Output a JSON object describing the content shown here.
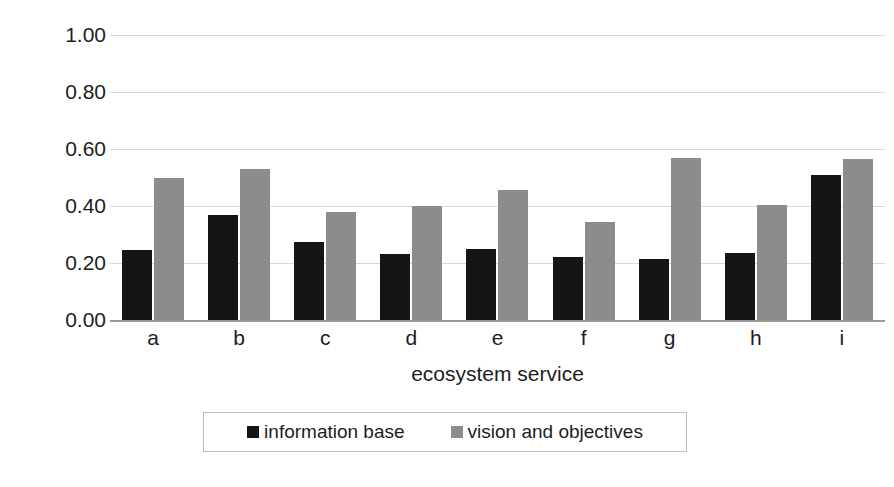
{
  "chart_data": {
    "type": "bar",
    "title": "",
    "xlabel": "ecosystem service",
    "ylabel": "depth score",
    "categories": [
      "a",
      "b",
      "c",
      "d",
      "e",
      "f",
      "g",
      "h",
      "i"
    ],
    "series": [
      {
        "name": "information base",
        "color": "#151515",
        "values": [
          0.245,
          0.37,
          0.275,
          0.23,
          0.25,
          0.22,
          0.215,
          0.235,
          0.51
        ]
      },
      {
        "name": "vision and objectives",
        "color": "#8c8c8c",
        "values": [
          0.5,
          0.53,
          0.38,
          0.4,
          0.455,
          0.345,
          0.57,
          0.405,
          0.565
        ]
      }
    ],
    "ylim": [
      0.0,
      1.0
    ],
    "yticks": [
      0.0,
      0.2,
      0.4,
      0.6,
      0.8,
      1.0
    ],
    "ytick_labels": [
      "0.00",
      "0.20",
      "0.40",
      "0.60",
      "0.80",
      "1.00"
    ],
    "grid": true,
    "grid_axis": "y",
    "legend_position": "bottom-center",
    "gridline_color": "#d9d9d9",
    "axis_color": "#9a9a9a",
    "background": "#ffffff"
  }
}
